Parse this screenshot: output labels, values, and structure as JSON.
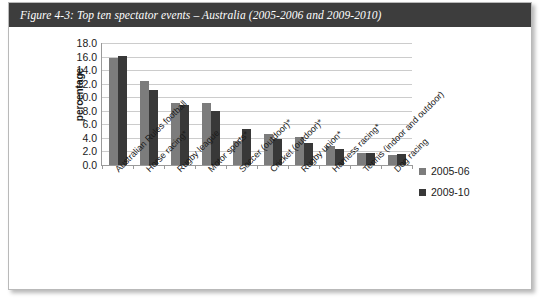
{
  "figure": {
    "caption": "Figure 4-3: Top ten spectator events – Australia (2005-2006 and 2009-2010)"
  },
  "colors": {
    "series_2005_06": "#7c7c7c",
    "series_2009_10": "#383838",
    "caption_bar": "#3d3d3d",
    "gridline": "#cccccc",
    "axis": "#9a9a9a"
  },
  "chart_data": {
    "type": "bar",
    "title": "Figure 4-3: Top ten spectator events – Australia (2005-2006 and 2009-2010)",
    "xlabel": "",
    "ylabel": "percentage",
    "ylim": [
      0.0,
      18.0
    ],
    "ytick_step": 2.0,
    "yticks": [
      "18.0",
      "16.0",
      "14.0",
      "12.0",
      "10.0",
      "8.0",
      "6.0",
      "4.0",
      "2.0",
      "0.0"
    ],
    "grid": "horizontal",
    "legend_position": "right",
    "categories": [
      "Australian Rules football",
      "Horse racing*",
      "Rugby league",
      "Motor sports*",
      "Soccer (outdoor)*",
      "Cricket (outdoor)*",
      "Rugby union*",
      "Harness racing*",
      "Tennis (indoor and outdoor)",
      "Dog racing"
    ],
    "series": [
      {
        "name": "2005-06",
        "color": "#7c7c7c",
        "values": [
          15.8,
          12.4,
          9.2,
          9.2,
          3.5,
          4.6,
          4.2,
          2.8,
          1.7,
          1.5
        ]
      },
      {
        "name": "2009-10",
        "color": "#383838",
        "values": [
          16.1,
          11.0,
          8.8,
          8.0,
          5.3,
          3.9,
          3.2,
          2.4,
          1.7,
          1.6
        ]
      }
    ]
  }
}
